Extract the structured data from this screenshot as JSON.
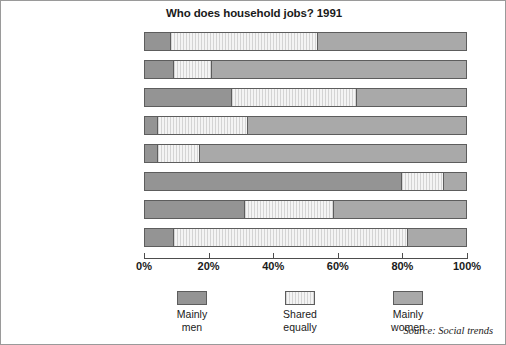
{
  "chart_data": {
    "type": "bar",
    "orientation": "horizontal",
    "stacked": true,
    "title": "Who does household jobs? 1991",
    "xlabel": "",
    "ylabel": "",
    "xlim": [
      0,
      100
    ],
    "xticks": [
      "0%",
      "20%",
      "40%",
      "60%",
      "80%",
      "100%"
    ],
    "xtick_values": [
      0,
      20,
      40,
      60,
      80,
      100
    ],
    "grid": false,
    "legend_position": "bottom",
    "categories": [
      "Shopping",
      "Making evening meal",
      "Washing dishes",
      "Cleaning house",
      "Washing and ironing",
      "Repairs",
      "Paying bills",
      "Disciplining children"
    ],
    "series": [
      {
        "name": "Mainly men",
        "color": "#949494",
        "values": [
          8,
          9,
          27,
          4,
          4,
          80,
          31,
          9
        ]
      },
      {
        "name": "Shared equally",
        "color": "#ededed",
        "values": [
          46,
          12,
          39,
          28,
          13,
          13,
          28,
          73
        ]
      },
      {
        "name": "Mainly women",
        "color": "#a9a9a9",
        "values": [
          46,
          79,
          34,
          68,
          83,
          7,
          41,
          18
        ]
      }
    ],
    "annotations": [
      "Source: Social trends"
    ]
  },
  "legend": {
    "items": [
      {
        "label_line1": "Mainly",
        "label_line2": "men",
        "swatch": "men"
      },
      {
        "label_line1": "Shared",
        "label_line2": "equally",
        "swatch": "shared"
      },
      {
        "label_line1": "Mainly",
        "label_line2": "women",
        "swatch": "women"
      }
    ]
  },
  "source": "Source: Social trends"
}
